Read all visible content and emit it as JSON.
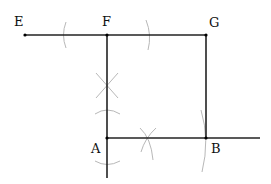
{
  "diagram": {
    "type": "geometric-construction",
    "colors": {
      "line": "#222222",
      "arc": "#b8b8b8",
      "point": "#000000",
      "label": "#111111"
    },
    "points": [
      {
        "id": "E",
        "label": "E",
        "x": 25,
        "y": 35
      },
      {
        "id": "F",
        "label": "F",
        "x": 107,
        "y": 35
      },
      {
        "id": "G",
        "label": "G",
        "x": 206,
        "y": 35
      },
      {
        "id": "A",
        "label": "A",
        "x": 107,
        "y": 138
      },
      {
        "id": "B",
        "label": "B",
        "x": 206,
        "y": 138
      }
    ],
    "labels": {
      "E": "E",
      "F": "F",
      "G": "G",
      "A": "A",
      "B": "B"
    },
    "segments": [
      {
        "from": "E",
        "to": "G",
        "description": "top line EG through F"
      },
      {
        "from": "F",
        "to": "A-extended",
        "description": "vertical line through F and A"
      },
      {
        "from": "G",
        "to": "B",
        "description": "vertical side GB"
      },
      {
        "from": "A",
        "to": "right-end",
        "description": "horizontal ray AB extended"
      }
    ],
    "arcs": [
      {
        "description": "arc mark on EF"
      },
      {
        "description": "arc mark on FG"
      },
      {
        "description": "perpendicular bisector X mark on FA"
      },
      {
        "description": "arc above A"
      },
      {
        "description": "arc below A"
      },
      {
        "description": "X mark on AB"
      },
      {
        "description": "arc through B"
      }
    ]
  }
}
